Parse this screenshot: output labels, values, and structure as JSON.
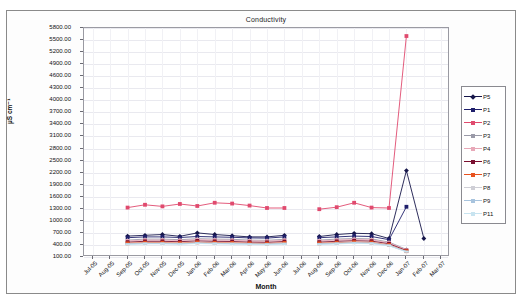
{
  "chart_data": {
    "type": "line",
    "title": "Conductivity",
    "xlabel": "Month",
    "ylabel": "µS cm⁻¹",
    "ylim": [
      100,
      5800
    ],
    "ytick_step": 300,
    "grid": true,
    "legend_position": "right",
    "ytick_labels": [
      "5800.00",
      "5500.00",
      "5200.00",
      "4900.00",
      "4600.00",
      "4300.00",
      "4000.00",
      "3700.00",
      "3400.00",
      "3100.00",
      "2800.00",
      "2500.00",
      "2200.00",
      "1900.00",
      "1600.00",
      "1300.00",
      "1000.00",
      "700.00",
      "400.00",
      "100.00"
    ],
    "categories": [
      "Jul-05",
      "Aug-05",
      "Sep-05",
      "Oct-05",
      "Nov-05",
      "Dec-05",
      "Jan-06",
      "Feb-06",
      "Mar-06",
      "Apr-06",
      "May-06",
      "Jun-06",
      "Jul-06",
      "Aug-06",
      "Sep-06",
      "Oct-06",
      "Nov-06",
      "Dec-06",
      "Jan-07",
      "Feb-07",
      "Mar-07"
    ],
    "series": [
      {
        "name": "P5",
        "color": "#16164a",
        "marker": "diamond",
        "values": [
          null,
          null,
          620,
          640,
          660,
          615,
          700,
          660,
          630,
          600,
          600,
          640,
          null,
          610,
          660,
          690,
          680,
          560,
          2250,
          560,
          null
        ]
      },
      {
        "name": "P1",
        "color": "#1f1f6b",
        "marker": "square",
        "values": [
          null,
          null,
          580,
          600,
          600,
          585,
          610,
          600,
          590,
          575,
          570,
          600,
          null,
          580,
          600,
          620,
          610,
          530,
          1350,
          null,
          null
        ]
      },
      {
        "name": "P2",
        "color": "#e04a6e",
        "marker": "square",
        "values": [
          null,
          null,
          1330,
          1400,
          1360,
          1420,
          1370,
          1450,
          1430,
          1380,
          1320,
          1320,
          null,
          1290,
          1340,
          1450,
          1330,
          1320,
          5600,
          null,
          null
        ]
      },
      {
        "name": "P3",
        "color": "#9a9aa8",
        "marker": "triangle",
        "values": [
          null,
          null,
          520,
          545,
          545,
          530,
          555,
          545,
          540,
          520,
          515,
          540,
          null,
          520,
          545,
          560,
          550,
          470,
          290,
          null,
          null
        ]
      },
      {
        "name": "P4",
        "color": "#e8a8b8",
        "marker": "square",
        "values": [
          null,
          null,
          500,
          520,
          520,
          510,
          530,
          520,
          515,
          500,
          495,
          515,
          null,
          500,
          520,
          535,
          525,
          455,
          275,
          null,
          null
        ]
      },
      {
        "name": "P6",
        "color": "#7a1030",
        "marker": "square",
        "values": [
          null,
          null,
          470,
          490,
          490,
          480,
          500,
          490,
          485,
          470,
          465,
          485,
          null,
          470,
          490,
          505,
          495,
          430,
          260,
          null,
          null
        ]
      },
      {
        "name": "P7",
        "color": "#e8521f",
        "marker": "square",
        "values": [
          null,
          null,
          440,
          455,
          455,
          445,
          465,
          455,
          450,
          440,
          435,
          450,
          null,
          440,
          455,
          470,
          460,
          400,
          245,
          null,
          null
        ]
      },
      {
        "name": "P8",
        "color": "#cfcfd6",
        "marker": "line",
        "values": [
          null,
          null,
          430,
          445,
          445,
          435,
          455,
          445,
          440,
          430,
          425,
          440,
          null,
          430,
          445,
          460,
          450,
          395,
          240,
          null,
          null
        ]
      },
      {
        "name": "P9",
        "color": "#a8c4de",
        "marker": "line",
        "values": [
          null,
          null,
          420,
          435,
          435,
          425,
          445,
          435,
          430,
          420,
          415,
          430,
          null,
          420,
          435,
          450,
          440,
          385,
          235,
          null,
          null
        ]
      },
      {
        "name": "P11",
        "color": "#c8e4f0",
        "marker": "line",
        "values": [
          null,
          null,
          410,
          425,
          425,
          415,
          435,
          425,
          420,
          410,
          405,
          420,
          null,
          410,
          425,
          440,
          430,
          380,
          230,
          null,
          null
        ]
      }
    ]
  }
}
